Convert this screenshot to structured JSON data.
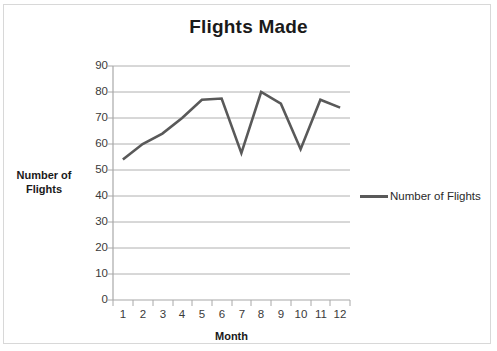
{
  "chart_data": {
    "type": "line",
    "title": "Flights Made",
    "xlabel": "Month",
    "ylabel": "Number of Flights",
    "categories": [
      "1",
      "2",
      "3",
      "4",
      "5",
      "6",
      "7",
      "8",
      "9",
      "10",
      "11",
      "12"
    ],
    "series": [
      {
        "name": "Number of Flights",
        "values": [
          54,
          60,
          64,
          70,
          77,
          77.5,
          56.5,
          80,
          75.5,
          58,
          77,
          74
        ],
        "color": "#595959"
      }
    ],
    "ylim": [
      0,
      90
    ],
    "ytick_labels": [
      "90",
      "80",
      "70",
      "60",
      "50",
      "40",
      "30",
      "20",
      "10",
      "0"
    ],
    "ytick_values": [
      90,
      80,
      70,
      60,
      50,
      40,
      30,
      20,
      10,
      0
    ],
    "grid": true,
    "grid_color": "#b0b0b0",
    "legend_position": "right",
    "legend_entries": [
      "Number of Flights"
    ]
  },
  "legend": {
    "label": "Number of Flights"
  }
}
